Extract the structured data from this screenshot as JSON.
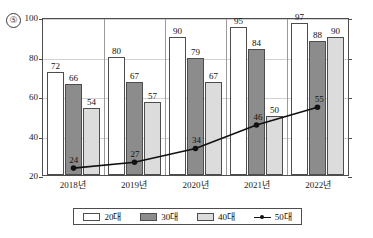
{
  "question_number": "⑤",
  "chart_data": {
    "type": "bar",
    "title": "",
    "subtitle": "",
    "xlabel": "",
    "ylabel": "",
    "ylim": [
      20,
      100
    ],
    "yticks": [
      20,
      40,
      60,
      80,
      100
    ],
    "grid": true,
    "legend_position": "bottom",
    "categories": [
      "2018년",
      "2019년",
      "2020년",
      "2021년",
      "2022년"
    ],
    "series": [
      {
        "name": "20대",
        "type": "bar",
        "color": "#ffffff",
        "values": [
          72,
          80,
          90,
          95,
          97
        ]
      },
      {
        "name": "30대",
        "type": "bar",
        "color": "#8c8c8c",
        "values": [
          66,
          67,
          79,
          84,
          88
        ]
      },
      {
        "name": "40대",
        "type": "bar",
        "color": "#dcdcdc",
        "values": [
          54,
          57,
          67,
          50,
          90
        ]
      },
      {
        "name": "50대",
        "type": "line",
        "color": "#111111",
        "values": [
          24,
          27,
          34,
          46,
          55
        ]
      }
    ]
  },
  "legend": {
    "items": [
      {
        "label": "20대",
        "style": "swatch",
        "swatch_class": "s0"
      },
      {
        "label": "30대",
        "style": "swatch",
        "swatch_class": "s1"
      },
      {
        "label": "40대",
        "style": "swatch",
        "swatch_class": "s2"
      },
      {
        "label": "50대",
        "style": "line"
      }
    ]
  }
}
